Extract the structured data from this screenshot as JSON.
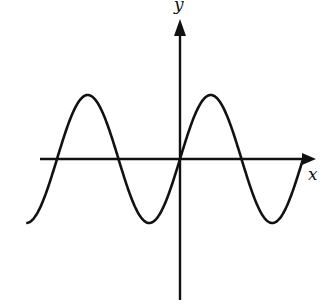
{
  "diagram": {
    "title": "",
    "type": "function-graph",
    "function": "y = A·sin(ωx), with x from -3π/ω to 2π/ω",
    "axes": {
      "x_label": "x",
      "y_label": "y"
    },
    "colors": {
      "stroke": "#111111",
      "background": "#ffffff"
    }
  },
  "chart_data": {
    "type": "line",
    "title": "",
    "xlabel": "x",
    "ylabel": "y",
    "grid": false,
    "legend": null,
    "tick_labels": [],
    "x": [
      -2.5,
      -2.0,
      -1.5,
      -1.0,
      -0.5,
      0.0,
      0.5,
      1.0,
      1.5,
      2.0
    ],
    "x_units": "quarter-periods relative to origin (1 unit = half period)",
    "values": [
      0,
      1,
      0,
      -1,
      0,
      0,
      1,
      0,
      -1,
      0
    ],
    "key_points": [
      {
        "label": "left start",
        "x": -2.5,
        "y": 0
      },
      {
        "label": "peak",
        "x": -2.0,
        "y": 1
      },
      {
        "label": "zero",
        "x": -1.5,
        "y": 0
      },
      {
        "label": "trough",
        "x": -1.0,
        "y": -1
      },
      {
        "label": "origin",
        "x": 0.0,
        "y": 0
      },
      {
        "label": "peak",
        "x": 0.5,
        "y": 1
      },
      {
        "label": "zero",
        "x": 1.0,
        "y": 0
      },
      {
        "label": "trough",
        "x": 1.5,
        "y": -1
      },
      {
        "label": "right end",
        "x": 2.0,
        "y": 0
      }
    ]
  }
}
